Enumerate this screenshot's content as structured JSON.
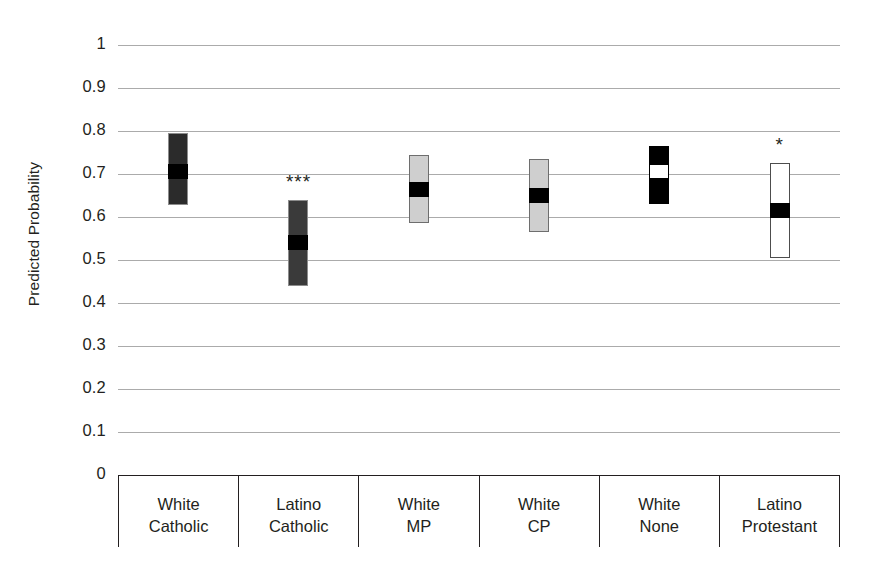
{
  "chart_data": {
    "type": "bar",
    "title": "",
    "subtitle": "",
    "xlabel": "",
    "ylabel": "Predicted Probability",
    "ylim": [
      0,
      1
    ],
    "ytick_labels": [
      "1",
      "0.9",
      "0.8",
      "0.7",
      "0.6",
      "0.5",
      "0.4",
      "0.3",
      "0.2",
      "0.1",
      "0"
    ],
    "ytick_values": [
      1,
      0.9,
      0.8,
      0.7,
      0.6,
      0.5,
      0.4,
      0.3,
      0.2,
      0.1,
      0
    ],
    "grid": true,
    "legend": "none",
    "categories": [
      "White Catholic",
      "Latino Catholic",
      "White MP",
      "White CP",
      "White None",
      "Latino Protestant"
    ],
    "category_lines": [
      [
        "White",
        "Catholic"
      ],
      [
        "Latino",
        "Catholic"
      ],
      [
        "White",
        "MP"
      ],
      [
        "White",
        "CP"
      ],
      [
        "White",
        "None"
      ],
      [
        "Latino",
        "Protestant"
      ]
    ],
    "series": [
      {
        "name": "Predicted probability with 95% confidence interval",
        "points": [
          {
            "category": "White Catholic",
            "value": 0.705,
            "ci_low": 0.628,
            "ci_high": 0.795,
            "significance": "",
            "bar_fill": "#2b2b2b",
            "bar_border": "#8c8c8c",
            "marker_fill": "#000000"
          },
          {
            "category": "Latino Catholic",
            "value": 0.54,
            "ci_low": 0.44,
            "ci_high": 0.64,
            "significance": "***",
            "bar_fill": "#3a3a3a",
            "bar_border": "#8c8c8c",
            "marker_fill": "#000000"
          },
          {
            "category": "White MP",
            "value": 0.665,
            "ci_low": 0.585,
            "ci_high": 0.745,
            "significance": "",
            "bar_fill": "#cfcfcf",
            "bar_border": "#6e6e6e",
            "marker_fill": "#000000"
          },
          {
            "category": "White CP",
            "value": 0.65,
            "ci_low": 0.565,
            "ci_high": 0.735,
            "significance": "",
            "bar_fill": "#cfcfcf",
            "bar_border": "#6e6e6e",
            "marker_fill": "#000000"
          },
          {
            "category": "White None",
            "value": 0.705,
            "ci_low": 0.63,
            "ci_high": 0.765,
            "significance": "",
            "bar_fill": "#000000",
            "bar_border": "#000000",
            "marker_fill": "#ffffff"
          },
          {
            "category": "Latino Protestant",
            "value": 0.615,
            "ci_low": 0.505,
            "ci_high": 0.725,
            "significance": "*",
            "bar_fill": "#ffffff",
            "bar_border": "#4d4d4d",
            "marker_fill": "#000000"
          }
        ]
      }
    ],
    "colors": {
      "gridline": "#8f8f8f",
      "axis": "#231f20",
      "text": "#231f20",
      "background": "#ffffff"
    }
  }
}
